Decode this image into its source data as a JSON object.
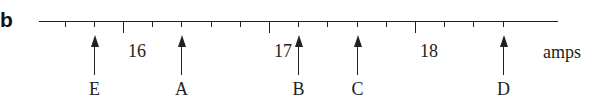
{
  "panel_label": "b",
  "scale": {
    "unit": "amps",
    "min_value": 15.2,
    "max_value": 18.8,
    "minor_step": 0.2,
    "major_labels": [
      "16",
      "17",
      "18"
    ],
    "major_values": [
      16,
      17,
      18
    ],
    "line_start_x": 39,
    "line_end_x": 558,
    "line_y": 21,
    "px_per_unit": 146,
    "origin_value": 16,
    "origin_x": 123,
    "ticks": [
      15.6,
      15.8,
      16.0,
      16.2,
      16.4,
      16.6,
      16.8,
      17.0,
      17.2,
      17.4,
      17.6,
      17.8,
      18.0,
      18.2,
      18.4,
      18.6
    ]
  },
  "arrows": [
    {
      "label": "E",
      "value": 15.8
    },
    {
      "label": "A",
      "value": 16.4
    },
    {
      "label": "B",
      "value": 17.2
    },
    {
      "label": "C",
      "value": 17.6
    },
    {
      "label": "D",
      "value": 18.6
    }
  ],
  "chart_data": {
    "type": "scatter",
    "title": "",
    "xlabel": "amps",
    "ylabel": "",
    "xlim": [
      15.5,
      18.8
    ],
    "x_ticks": [
      16,
      17,
      18
    ],
    "minor_tick_step": 0.2,
    "points": [
      {
        "label": "E",
        "x": 15.8
      },
      {
        "label": "A",
        "x": 16.4
      },
      {
        "label": "B",
        "x": 17.2
      },
      {
        "label": "C",
        "x": 17.6
      },
      {
        "label": "D",
        "x": 18.6
      }
    ],
    "panel": "b"
  }
}
